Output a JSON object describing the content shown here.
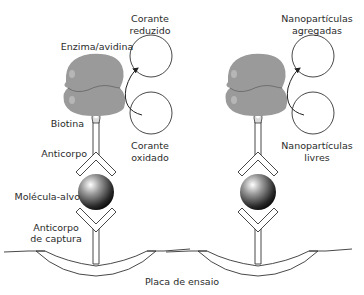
{
  "diagram": {
    "title": "",
    "left_assay": {
      "labels": {
        "enzyme": "Enzima/avidina",
        "biotin": "Biotina",
        "antibody": "Anticorpo",
        "target": "Molécula-alvo",
        "capture_antibody_line1": "Anticorpo",
        "capture_antibody_line2": "de captura",
        "reduced_dye_line1": "Corante",
        "reduced_dye_line2": "reduzido",
        "oxidized_dye_line1": "Corante",
        "oxidized_dye_line2": "oxidado"
      }
    },
    "right_assay": {
      "labels": {
        "aggregated_line1": "Nanopartículas",
        "aggregated_line2": "agregadas",
        "free_line1": "Nanopartículas",
        "free_line2": "livres"
      }
    },
    "plate_label": "Placa de ensaio",
    "colors": {
      "enzyme_fill": "#9a9a9a",
      "line": "#333333",
      "sphere_dark": "#111111",
      "sphere_light": "#f0f0f0",
      "text": "#2b2b2b"
    }
  }
}
